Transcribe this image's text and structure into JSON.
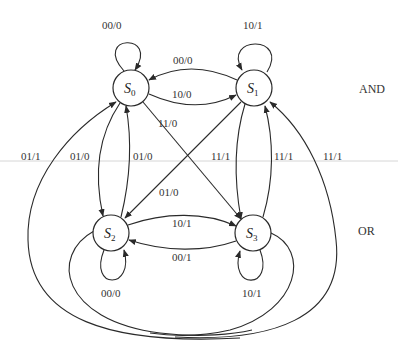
{
  "diagram": {
    "type": "finite-state-machine",
    "states": [
      {
        "id": "S0",
        "letter": "S",
        "sub": "0"
      },
      {
        "id": "S1",
        "letter": "S",
        "sub": "1"
      },
      {
        "id": "S2",
        "letter": "S",
        "sub": "2"
      },
      {
        "id": "S3",
        "letter": "S",
        "sub": "3"
      }
    ],
    "self_loops": {
      "s0": "00/0",
      "s1": "10/1",
      "s2": "00/0",
      "s3": "10/1"
    },
    "edges": {
      "s1_to_s0": "00/0",
      "s0_to_s1": "10/0",
      "s0_to_s3": "11/0",
      "s1_to_s2": "01/0",
      "s2_to_s3": "10/1",
      "s3_to_s2": "00/1",
      "outer_left_to_s0": "01/1",
      "s0_to_s2": "01/0",
      "s2_to_s0": "01/0",
      "s1_to_s3": "11/1",
      "s3_to_s1": "11/1",
      "outer_right_to_s1": "11/1"
    },
    "side_labels": {
      "top": "AND",
      "bottom": "OR"
    },
    "colors": {
      "stroke": "#2a2a2a",
      "text": "#333333",
      "guide_line": "#d6d6d6"
    }
  }
}
